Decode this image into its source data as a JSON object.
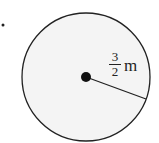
{
  "diagram": {
    "shape": "circle",
    "radius_label": {
      "numerator": "3",
      "denominator": "2",
      "unit": "m"
    },
    "colors": {
      "fill": "#f4f4f4",
      "stroke": "#222222"
    }
  }
}
